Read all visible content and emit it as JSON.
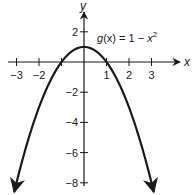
{
  "chart_data": {
    "type": "line",
    "title": "",
    "function_label": "g(x) = 1 − x²",
    "function_label_parts": {
      "name": "g",
      "arg": "(x)",
      "eq": " = 1 − ",
      "var": "x",
      "exp": "2"
    },
    "xlabel": "x",
    "ylabel": "y",
    "xlim": [
      -3.1,
      4.3
    ],
    "ylim": [
      -8.7,
      4.1
    ],
    "x_ticks": [
      -3,
      -2,
      -1,
      1,
      2,
      3
    ],
    "x_tick_labels": [
      "−3",
      "−2",
      "",
      "1",
      "2",
      "3"
    ],
    "y_ticks": [
      2,
      -2,
      -4,
      -6,
      -8
    ],
    "y_tick_labels": [
      "2",
      "−2",
      "−4",
      "−6",
      "−8"
    ],
    "grid": false,
    "legend": "none",
    "series": [
      {
        "name": "g(x) = 1 − x²",
        "x": [
          -3.1,
          -3,
          -2.5,
          -2,
          -1.5,
          -1,
          -0.5,
          0,
          0.5,
          1,
          1.5,
          2,
          2.5,
          3,
          3.1
        ],
        "y": [
          -8.61,
          -8,
          -5.25,
          -3,
          -1.25,
          0,
          0.75,
          1,
          0.75,
          0,
          -1.25,
          -3,
          -5.25,
          -8,
          -8.61
        ],
        "color": "#1a1a1a",
        "arrows_at_ends": true
      }
    ],
    "colors": {
      "stroke": "#1a1a1a",
      "background": "#ffffff"
    }
  }
}
